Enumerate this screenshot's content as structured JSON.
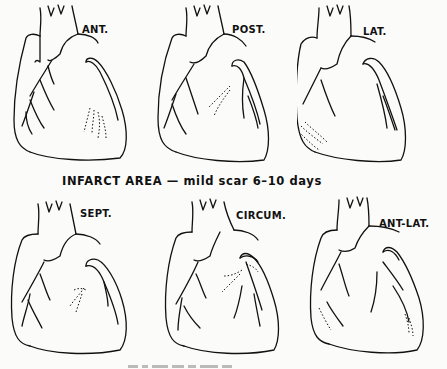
{
  "figure": {
    "caption_middle": "INFARCT AREA — mild scar 6–10 days",
    "caption_bottom_visible": false
  },
  "panels": [
    {
      "label": "ANT.",
      "region": "anterior"
    },
    {
      "label": "POST.",
      "region": "posterior"
    },
    {
      "label": "LAT.",
      "region": "lateral"
    },
    {
      "label": "SEPT.",
      "region": "septal"
    },
    {
      "label": "CIRCUM.",
      "region": "circumferential"
    },
    {
      "label": "ANT-LAT.",
      "region": "anterolateral"
    }
  ],
  "style": {
    "line_color": "#111111",
    "background": "#fbfbfa"
  }
}
